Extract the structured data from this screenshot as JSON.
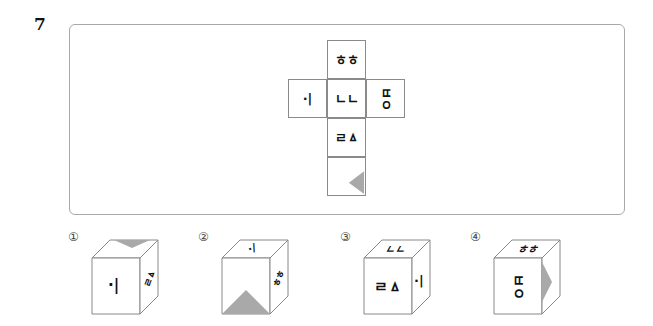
{
  "question": {
    "number": "7"
  },
  "net": {
    "faces": [
      {
        "id": "top",
        "glyph": "ㅎㅎ",
        "rotation": 0
      },
      {
        "id": "left",
        "glyph": "·|",
        "rotation": 0
      },
      {
        "id": "center",
        "glyph": "ㄴㄴ",
        "rotation": 0
      },
      {
        "id": "right",
        "glyph": "ㅂㅇ",
        "rotation": 90
      },
      {
        "id": "below-center",
        "glyph": "ㄹㅿ",
        "rotation": 0
      },
      {
        "id": "bottom",
        "glyph": "",
        "shape": "gray-triangle-pointing-left"
      }
    ],
    "triangle_color": "#a9a9a9"
  },
  "options": [
    {
      "number": "①",
      "front": "·|",
      "right": "ㄹㅿ",
      "top": "gray-triangle"
    },
    {
      "number": "②",
      "front": "gray-triangle",
      "right": "ㅎㅎ",
      "top": "·/"
    },
    {
      "number": "③",
      "front": "ㄹㅿ",
      "right": "·|",
      "top": "ㄴㄴ"
    },
    {
      "number": "④",
      "front": "ㅂㅇ",
      "right": "gray-triangle",
      "top": "ㅎㅎ"
    }
  ]
}
